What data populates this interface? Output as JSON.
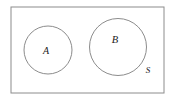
{
  "figure": {
    "kind": "venn-diagram",
    "background_color": "#ffffff",
    "stroke_color": "#8c8c8c",
    "label_color": "#1a1a1a",
    "stroke_width": 1
  },
  "universe": {
    "name": "universal-set-rectangle",
    "label": "S",
    "label_x": 148,
    "label_y": 71,
    "x": 11,
    "y": 7,
    "width": 153,
    "height": 86
  },
  "sets": [
    {
      "name": "set-a",
      "label": "A",
      "cx": 48,
      "cy": 50,
      "r": 24,
      "label_x": 46,
      "label_y": 52
    },
    {
      "name": "set-b",
      "label": "B",
      "cx": 118,
      "cy": 47,
      "r": 28.5,
      "label_x": 115,
      "label_y": 41
    }
  ],
  "chart_data": {
    "type": "diagram",
    "diagram_type": "venn",
    "title": "",
    "universal_set": "S",
    "sets": [
      "A",
      "B"
    ],
    "relationship": "disjoint",
    "intersection": "empty"
  }
}
